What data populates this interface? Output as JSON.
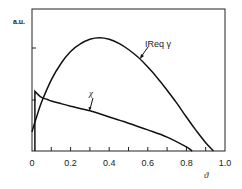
{
  "chart_data": {
    "type": "line",
    "title": "",
    "xlabel": "ϑ",
    "ylabel": "a.u.",
    "xlim": [
      0,
      1.0
    ],
    "ylim": [
      0,
      2.75
    ],
    "grid": false,
    "legend": "inline labels with leader lines",
    "x_ticks": [
      "0",
      "0.2",
      "0.4",
      "0.6",
      "0.8",
      "1.0"
    ],
    "x_minor_ticks": [
      0.1,
      0.3,
      0.5,
      0.7,
      0.9
    ],
    "y_ticks": [
      1,
      2
    ],
    "series": [
      {
        "name": "IReq γ",
        "x": [
          0.0,
          0.02,
          0.05,
          0.1,
          0.15,
          0.2,
          0.25,
          0.3,
          0.35,
          0.4,
          0.45,
          0.5,
          0.55,
          0.6,
          0.65,
          0.7,
          0.75,
          0.8,
          0.85,
          0.9,
          0.94
        ],
        "values": [
          0.37,
          0.62,
          0.95,
          1.38,
          1.7,
          1.93,
          2.08,
          2.17,
          2.2,
          2.17,
          2.09,
          1.97,
          1.82,
          1.63,
          1.42,
          1.18,
          0.93,
          0.66,
          0.4,
          0.16,
          0.0
        ]
      },
      {
        "name": "χ",
        "x": [
          0.015,
          0.015,
          0.03,
          0.05,
          0.08,
          0.1,
          0.15,
          0.2,
          0.3,
          0.4,
          0.5,
          0.6,
          0.7,
          0.8,
          0.83
        ],
        "values": [
          0.0,
          1.16,
          1.1,
          1.04,
          1.0,
          0.97,
          0.92,
          0.87,
          0.78,
          0.66,
          0.54,
          0.41,
          0.27,
          0.08,
          0.0
        ]
      }
    ],
    "annotations": [
      {
        "text": "IReq γ",
        "x": 0.59,
        "y": 2.0
      },
      {
        "text": "χ",
        "x": 0.31,
        "y": 1.12
      }
    ]
  },
  "axis": {
    "y_unit_label": "a.u.",
    "x_label": "ϑ",
    "x_tick_labels": [
      "0",
      "0.2",
      "0.4",
      "0.6",
      "0.8",
      "1.0"
    ]
  },
  "labels": {
    "ireq_gamma": "IReq γ",
    "chi": "χ"
  },
  "colors": {
    "line": "#111111",
    "frame": "#222222",
    "background": "#ffffff"
  }
}
